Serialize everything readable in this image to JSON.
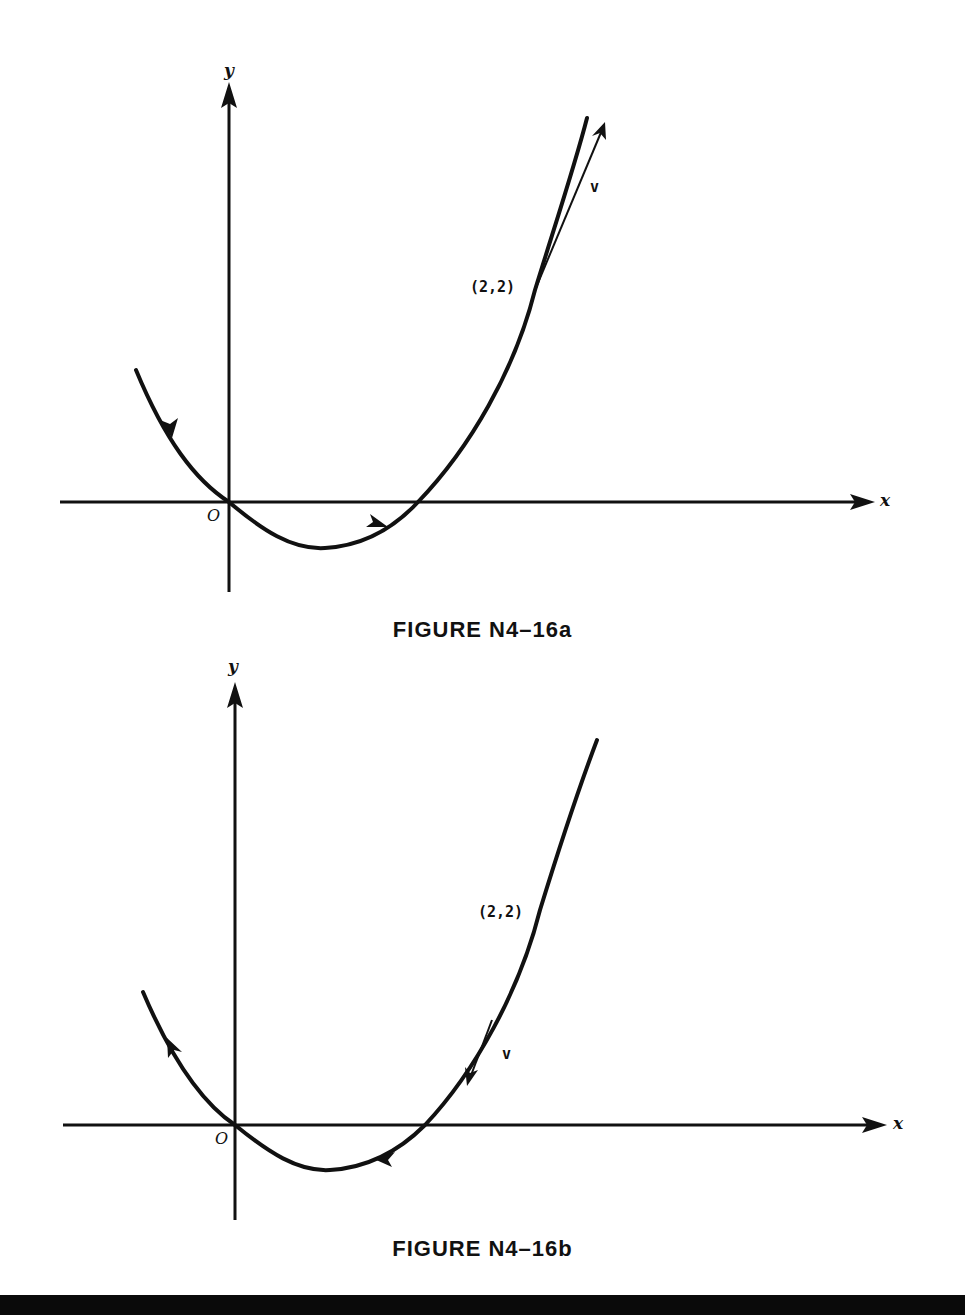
{
  "figures": [
    {
      "id": "a",
      "caption": "FIGURE N4–16a",
      "x_axis_label": "x",
      "y_axis_label": "y",
      "origin_label": "O",
      "point_label": "(2,2)",
      "vector_label": "v",
      "direction": "increasing-x",
      "vector_direction": "up-right (tangent, along motion)"
    },
    {
      "id": "b",
      "caption": "FIGURE N4–16b",
      "x_axis_label": "x",
      "y_axis_label": "y",
      "origin_label": "O",
      "point_label": "(2,2)",
      "vector_label": "v",
      "direction": "decreasing-x",
      "vector_direction": "down-left (tangent, along motion)"
    }
  ],
  "colors": {
    "ink": "#111111",
    "paper": "#ffffff",
    "bottom_bar": "#0a0a0a"
  }
}
